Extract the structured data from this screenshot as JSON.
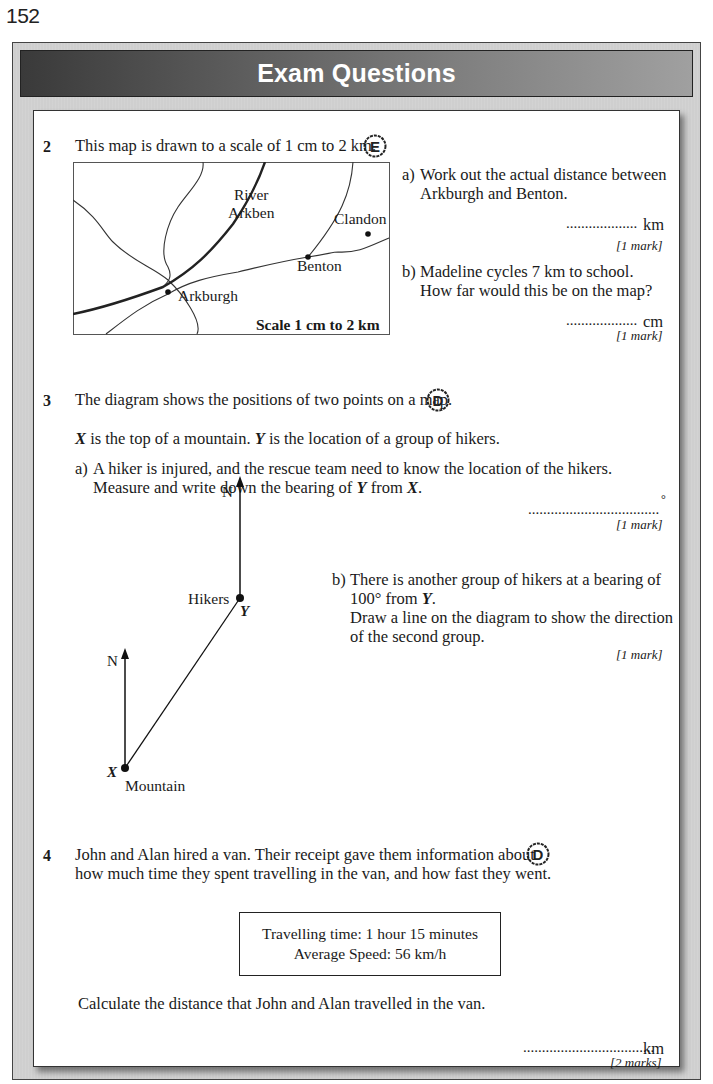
{
  "page_number": "152",
  "header": {
    "title": "Exam Questions"
  },
  "questions": [
    {
      "number": "2",
      "grade": "E",
      "stem": "This map is drawn to a scale of 1 cm to 2 km.",
      "map": {
        "labels": {
          "river": [
            "River",
            "Arkben"
          ],
          "arkburgh": "Arkburgh",
          "benton": "Benton",
          "clandon": "Clandon",
          "scale": "Scale 1 cm to 2 km"
        }
      },
      "parts": [
        {
          "label": "a)",
          "lines": [
            "Work out the actual distance between",
            "Arkburgh and Benton."
          ],
          "answer_dots": "...................",
          "answer_unit": "km",
          "marks": "[1 mark]"
        },
        {
          "label": "b)",
          "lines": [
            "Madeline cycles 7 km to school.",
            "How far would this be on the map?"
          ],
          "answer_dots": "...................",
          "answer_unit": "cm",
          "marks": "[1 mark]"
        }
      ]
    },
    {
      "number": "3",
      "grade": "D",
      "stem": "The diagram shows the positions of two points on a map.",
      "intro_parts": [
        "X",
        " is the top of a mountain.  ",
        "Y",
        " is the location of a group of hikers."
      ],
      "parts": [
        {
          "label": "a)",
          "lines": [
            "A hiker is injured, and the rescue team need to know the location of the hikers."
          ],
          "line2_parts": [
            "Measure and write down the bearing of ",
            "Y",
            " from ",
            "X",
            "."
          ],
          "answer_dots": "...................................",
          "answer_unit": "°",
          "marks": "[1 mark]"
        },
        {
          "label": "b)",
          "line1": "There is another group of hikers at a bearing of",
          "line2_parts": [
            "100° from ",
            "Y",
            "."
          ],
          "line3": "Draw a line on the diagram to show the direction",
          "line4": "of the second group.",
          "marks": "[1 mark]"
        }
      ],
      "diagram": {
        "north_label": "N",
        "point_y_name": "Hikers",
        "point_y_letter": "Y",
        "point_x_name": "Mountain",
        "point_x_letter": "X"
      }
    },
    {
      "number": "4",
      "grade": "D",
      "lines": [
        "John and Alan hired a van.  Their receipt gave them information about",
        "how much time they spent travelling in the van, and how fast they went."
      ],
      "receipt": {
        "line1": "Travelling time: 1 hour 15 minutes",
        "line2": "Average Speed: 56 km/h"
      },
      "question": "Calculate the distance that John and Alan travelled in the van.",
      "answer_dots": "...................................",
      "answer_unit": "km",
      "marks": "[2 marks]"
    }
  ],
  "colors": {
    "frame_gray": "#cfcfcf",
    "title_gradient_start": "#3a3a3a",
    "title_gradient_end": "#a0a0a0",
    "title_text": "#ffffff"
  }
}
